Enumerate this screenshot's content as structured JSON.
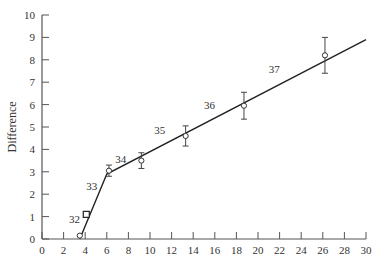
{
  "chart_data": {
    "type": "line",
    "title": "",
    "xlabel": "",
    "ylabel": "Difference",
    "xlim": [
      0,
      30
    ],
    "ylim": [
      0,
      10
    ],
    "grid": false,
    "legend": null,
    "x_ticks": [
      0,
      2,
      4,
      6,
      8,
      10,
      12,
      14,
      16,
      18,
      20,
      22,
      24,
      26,
      28,
      30
    ],
    "y_ticks": [
      0,
      1,
      2,
      3,
      4,
      5,
      6,
      7,
      8,
      9,
      10
    ],
    "fit_line": {
      "name": "fit",
      "x": [
        3.5,
        6.0,
        30.0
      ],
      "y": [
        0.0,
        2.9,
        8.9
      ]
    },
    "series": [
      {
        "name": "observations",
        "marker": "circle",
        "points": [
          {
            "x": 3.5,
            "y": 0.15,
            "err": 0
          },
          {
            "x": 6.2,
            "y": 3.05,
            "err_low": 0.25,
            "err_high": 0.25
          },
          {
            "x": 9.2,
            "y": 3.5,
            "err": 0.35
          },
          {
            "x": 13.3,
            "y": 4.6,
            "err": 0.45
          },
          {
            "x": 18.7,
            "y": 5.95,
            "err": 0.6
          },
          {
            "x": 26.2,
            "y": 8.2,
            "err": 0.8
          }
        ]
      },
      {
        "name": "square-point",
        "marker": "square",
        "points": [
          {
            "x": 4.1,
            "y": 1.1,
            "err": 0
          }
        ]
      }
    ],
    "annotations": [
      {
        "text": "32",
        "x": 3.0,
        "y": 0.7
      },
      {
        "text": "33",
        "x": 4.6,
        "y": 2.2
      },
      {
        "text": "34",
        "x": 7.3,
        "y": 3.4
      },
      {
        "text": "35",
        "x": 10.9,
        "y": 4.7
      },
      {
        "text": "36",
        "x": 15.5,
        "y": 5.8
      },
      {
        "text": "37",
        "x": 21.5,
        "y": 7.4
      }
    ]
  }
}
